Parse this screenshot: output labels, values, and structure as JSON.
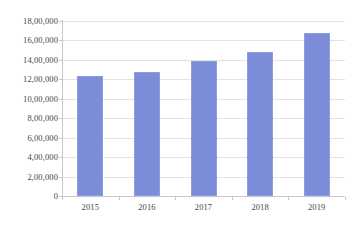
{
  "chart_data": {
    "type": "bar",
    "title": "",
    "subtitle": "",
    "xlabel": "",
    "ylabel": "",
    "categories": [
      "2015",
      "2016",
      "2017",
      "2018",
      "2019"
    ],
    "values": [
      1230000,
      1275000,
      1390000,
      1485000,
      1675000
    ],
    "series": [
      {
        "name": "",
        "values": [
          1230000,
          1275000,
          1390000,
          1485000,
          1675000
        ],
        "color": "#7c8cd9"
      }
    ],
    "ylim": [
      0,
      1800000
    ],
    "ytick_values": [
      0,
      200000,
      400000,
      600000,
      800000,
      1000000,
      1200000,
      1400000,
      1600000,
      1800000
    ],
    "ytick_labels": [
      "0",
      "2,00,000",
      "4,00,000",
      "6,00,000",
      "8,00,000",
      "10,00,000",
      "12,00,000",
      "14,00,000",
      "16,00,000",
      "18,00,000"
    ],
    "xtick_labels": [
      "2015",
      "2016",
      "2017",
      "2018",
      "2019"
    ],
    "grid": {
      "horizontal": true,
      "vertical": false,
      "color": "#e2e2e2"
    },
    "legend": {
      "visible": false,
      "position": "none",
      "entries": []
    },
    "annotations": [],
    "data_labels_visible": false,
    "background_color": "#ffffff",
    "axis_text_color": "#454545",
    "axis_line_color": "#c8c8c8"
  }
}
